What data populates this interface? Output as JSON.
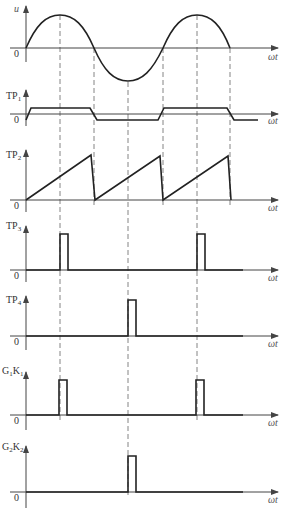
{
  "diagram": {
    "x_axis_label": "ωt",
    "origin_label": "0",
    "sync_lines_x": [
      60,
      94,
      128,
      163,
      197,
      230
    ],
    "panels": [
      {
        "id": "u",
        "label": "u",
        "sub": "",
        "sub2": "",
        "type": "sine"
      },
      {
        "id": "tp1",
        "label": "TP",
        "sub": "1",
        "sub2": "",
        "type": "square"
      },
      {
        "id": "tp2",
        "label": "TP",
        "sub": "2",
        "sub2": "",
        "type": "sawtooth"
      },
      {
        "id": "tp3",
        "label": "TP",
        "sub": "3",
        "sub2": "",
        "type": "pulse",
        "pulses_x": [
          60,
          197
        ]
      },
      {
        "id": "tp4",
        "label": "TP",
        "sub": "4",
        "sub2": "",
        "type": "pulse",
        "pulses_x": [
          128
        ]
      },
      {
        "id": "g1k1",
        "label": "G",
        "sub": "1",
        "mid": "K",
        "sub2": "1",
        "type": "pulse",
        "pulses_x": [
          60,
          197
        ]
      },
      {
        "id": "g2k2",
        "label": "G",
        "sub": "2",
        "mid": "K",
        "sub2": "2",
        "type": "pulse",
        "pulses_x": [
          128
        ]
      }
    ]
  }
}
